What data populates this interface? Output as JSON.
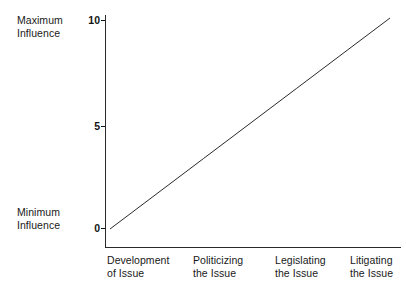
{
  "chart_data": {
    "type": "line",
    "title": "",
    "subtitle": "",
    "xlabel": "",
    "ylabel": "",
    "categories": [
      "Development\nof Issue",
      "Politicizing\nthe Issue",
      "Legislating\nthe Issue",
      "Litigating\nthe Issue"
    ],
    "x": [
      0,
      1,
      2,
      3
    ],
    "series": [
      {
        "name": "Influence",
        "values": [
          0,
          3.33,
          6.67,
          10
        ]
      }
    ],
    "ylim": [
      0,
      10
    ],
    "yticks": [
      "0",
      "5",
      "10"
    ],
    "ytick_values": [
      0,
      5,
      10
    ],
    "y_axis_min_label": "Minimum\nInfluence",
    "y_axis_max_label": "Maximum\nInfluence",
    "grid": false,
    "legend": false,
    "legend_position": "none",
    "line_color": "#2a2a2a",
    "axis_color": "#2a2a2a",
    "background_color": "#ffffff"
  },
  "axis": {
    "y_max_label": "Maximum\nInfluence",
    "y_min_label": "Minimum\nInfluence",
    "tick_10": "10",
    "tick_5": "5",
    "tick_0": "0"
  },
  "categories": {
    "c0": "Development\nof Issue",
    "c1": "Politicizing\nthe Issue",
    "c2": "Legislating\nthe Issue",
    "c3": "Litigating\nthe Issue"
  }
}
